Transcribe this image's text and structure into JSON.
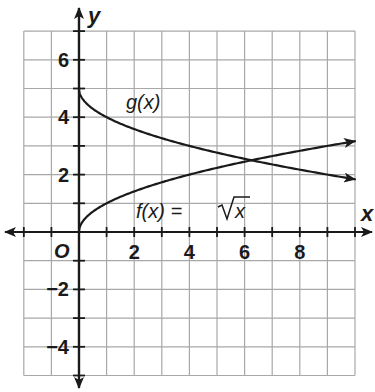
{
  "chart_data": {
    "type": "line",
    "title": "",
    "xlabel": "x",
    "ylabel": "y",
    "xlim": [
      -2,
      10
    ],
    "ylim": [
      -5,
      7
    ],
    "grid": true,
    "grid_step": 1,
    "origin_label": "O",
    "x_tick_labels": [
      {
        "value": 2,
        "label": "2"
      },
      {
        "value": 4,
        "label": "4"
      },
      {
        "value": 6,
        "label": "6"
      },
      {
        "value": 8,
        "label": "8"
      }
    ],
    "y_tick_labels": [
      {
        "value": 6,
        "label": "6"
      },
      {
        "value": 4,
        "label": "4"
      },
      {
        "value": 2,
        "label": "2"
      },
      {
        "value": -2,
        "label": "−2"
      },
      {
        "value": -4,
        "label": "−4"
      }
    ],
    "series": [
      {
        "name": "f(x) = √x",
        "label": "f(x) = √x",
        "expression": "sqrt(x)",
        "x": [
          0,
          1,
          2,
          4,
          6,
          8,
          10
        ],
        "y": [
          0,
          1,
          1.41,
          2,
          2.45,
          2.83,
          3.16
        ],
        "end_arrow": true
      },
      {
        "name": "g(x)",
        "label": "g(x)",
        "expression": "5 - sqrt(x)",
        "x": [
          0,
          1,
          2,
          4,
          6,
          8,
          10
        ],
        "y": [
          5,
          4,
          3.59,
          3,
          2.55,
          2.17,
          1.84
        ],
        "end_arrow": true
      }
    ],
    "annotations": [
      {
        "text": "g(x)",
        "x": 1.8,
        "y": 4.4
      },
      {
        "text": "f(x) = √x",
        "x": 2.1,
        "y": 0.5
      }
    ],
    "intersection": {
      "x": 6.25,
      "y": 2.5
    }
  },
  "labels": {
    "x_axis": "x",
    "y_axis": "y",
    "origin": "O",
    "g_label": "g(x)",
    "f_label_prefix": "f(x) = ",
    "f_label_radicand": "x"
  }
}
